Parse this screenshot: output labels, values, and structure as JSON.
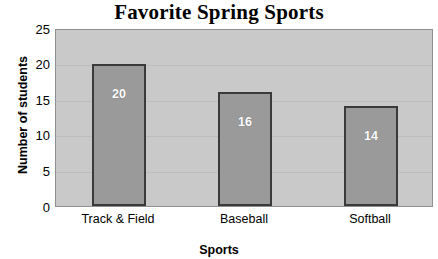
{
  "chart_data": {
    "type": "bar",
    "title": "Favorite Spring Sports",
    "xlabel": "Sports",
    "ylabel": "Number of students",
    "categories": [
      "Track & Field",
      "Baseball",
      "Softball"
    ],
    "values": [
      20,
      16,
      14
    ],
    "value_labels": [
      "20",
      "16",
      "14"
    ],
    "ylim": [
      0,
      25
    ],
    "ytick_labels": [
      "0",
      "5",
      "10",
      "15",
      "20",
      "25"
    ],
    "ytick_values": [
      0,
      5,
      10,
      15,
      20,
      25
    ],
    "grid": true,
    "legend": "none",
    "colors": {
      "bar_fill": "#9a9a9a",
      "bar_border": "#3a3a3a",
      "plot_background": "#c9c9c9",
      "gridline": "#bdbdbd",
      "value_label": "#ffffff",
      "text": "#000000",
      "page_background": "#ffffff"
    }
  }
}
